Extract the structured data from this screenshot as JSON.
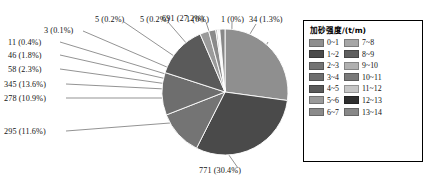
{
  "chart_data": {
    "type": "pie",
    "title": "",
    "legend_title": "加砂强度/(t/m)",
    "legend_position": "right",
    "total": 2538,
    "categories": [
      "0~1",
      "1~2",
      "2~3",
      "3~4",
      "4~5",
      "5~6",
      "6~7",
      "7~8",
      "8~9",
      "9~10",
      "10~11",
      "11~12",
      "12~13",
      "13~14"
    ],
    "values": [
      691,
      771,
      295,
      278,
      345,
      58,
      46,
      11,
      3,
      5,
      5,
      1,
      1,
      34
    ],
    "percents": [
      "27.2%",
      "30.4%",
      "11.6%",
      "10.9%",
      "13.6%",
      "2.3%",
      "1.8%",
      "0.4%",
      "0.1%",
      "0.2%",
      "0.2%",
      "0%",
      "0%",
      "1.3%"
    ],
    "colors": [
      "#8f8f8f",
      "#4a4a4a",
      "#747474",
      "#6e6e6e",
      "#5a5a5a",
      "#9a9a9a",
      "#8a8a8a",
      "#a6a6a6",
      "#5f5f5f",
      "#b0b0b0",
      "#7a7a7a",
      "#c6c6c6",
      "#2f2f2f",
      "#888888"
    ],
    "data_labels": [
      "691 (27.2%)",
      "771 (30.4%)",
      "295 (11.6%)",
      "278 (10.9%)",
      "345 (13.6%)",
      "58 (2.3%)",
      "46 (1.8%)",
      "11 (0.4%)",
      "3 (0.1%)",
      "5 (0.2%)",
      "5 (0.2%)",
      "1 (0%)",
      "1 (0%)",
      "34 (1.3%)"
    ]
  },
  "legend": {
    "title": "加砂强度/(t/m)",
    "left_column": [
      {
        "label": "0~1",
        "color": "#8f8f8f"
      },
      {
        "label": "1~2",
        "color": "#4a4a4a"
      },
      {
        "label": "2~3",
        "color": "#747474"
      },
      {
        "label": "3~4",
        "color": "#6e6e6e"
      },
      {
        "label": "4~5",
        "color": "#5a5a5a"
      },
      {
        "label": "5~6",
        "color": "#9a9a9a"
      },
      {
        "label": "6~7",
        "color": "#8a8a8a"
      }
    ],
    "right_column": [
      {
        "label": "7~8",
        "color": "#a6a6a6"
      },
      {
        "label": "8~9",
        "color": "#5f5f5f"
      },
      {
        "label": "9~10",
        "color": "#b0b0b0"
      },
      {
        "label": "10~11",
        "color": "#7a7a7a"
      },
      {
        "label": "11~12",
        "color": "#c6c6c6"
      },
      {
        "label": "12~13",
        "color": "#2f2f2f"
      },
      {
        "label": "13~14",
        "color": "#888888"
      }
    ]
  },
  "callouts": {
    "l_11": "11 (0.4%)",
    "l_46": "46 (1.8%)",
    "l_58": "58 (2.3%)",
    "l_345": "345 (13.6%)",
    "l_278": "278 (10.9%)",
    "l_295": "295 (11.6%)",
    "l_3": "3 (0.1%)",
    "l_5a": "5 (0.2%)",
    "l_5b": "5 (0.2%)",
    "l_1a": "1 (0%)",
    "l_1b": "1 (0%)",
    "l_34": "34 (1.3%)",
    "l_691": "691 (27.2%)",
    "l_771": "771 (30.4%)"
  }
}
